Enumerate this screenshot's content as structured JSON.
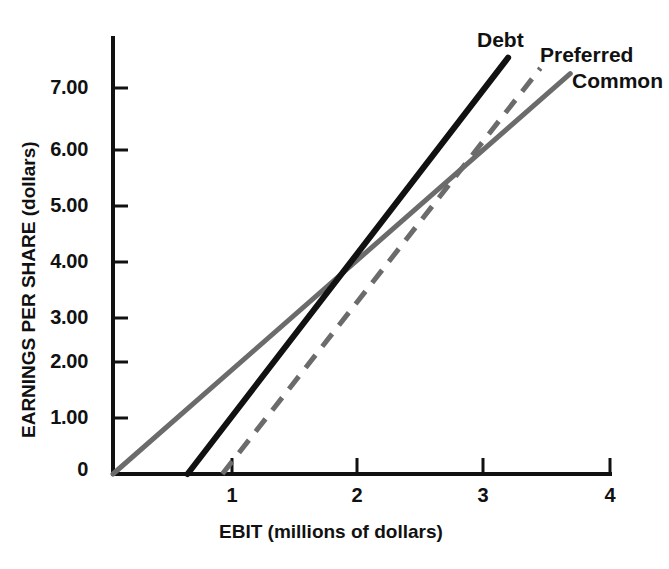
{
  "chart_data": {
    "type": "line",
    "title": "",
    "subtitle": "",
    "xlabel": "EBIT (millions of dollars)",
    "ylabel": "EARNINGS PER SHARE (dollars)",
    "xlim": [
      0,
      4
    ],
    "ylim": [
      0,
      7.8
    ],
    "grid": false,
    "legend_position": "inline-right-of-line-ends",
    "x_ticks": [
      "1",
      "2",
      "3",
      "4"
    ],
    "x_tick_values": [
      1,
      2,
      3,
      4
    ],
    "y_ticks": [
      "0",
      "1.00",
      "2.00",
      "3.00",
      "4.00",
      "5.00",
      "6.00",
      "7.00"
    ],
    "y_tick_values": [
      0,
      1,
      2,
      3,
      4,
      5,
      6,
      7
    ],
    "series": [
      {
        "name": "Debt",
        "style": "solid",
        "color": "#111111",
        "x_intercept": 0.6,
        "slope": 2.93,
        "points": [
          [
            0.6,
            0
          ],
          [
            3.18,
            7.55
          ]
        ],
        "values": [
          0,
          1.17,
          4.1,
          7.03
        ]
      },
      {
        "name": "Preferred",
        "style": "dashed",
        "color": "#6b6b6b",
        "x_intercept": 0.88,
        "slope": 2.87,
        "points": [
          [
            0.88,
            0
          ],
          [
            3.44,
            7.36
          ]
        ],
        "values": [
          0,
          0.34,
          3.21,
          6.09
        ]
      },
      {
        "name": "Common",
        "style": "solid",
        "color": "#6b6b6b",
        "x_intercept": 0.0,
        "slope": 1.97,
        "points": [
          [
            0.0,
            0
          ],
          [
            3.68,
            7.26
          ]
        ],
        "values": [
          0,
          1.97,
          3.95,
          5.92
        ]
      }
    ],
    "annotations": [
      {
        "label": "Debt/Common crossover",
        "x": 1.87,
        "y": 3.63
      },
      {
        "label": "Preferred/Common crossover",
        "x": 2.66,
        "y": 5.22
      }
    ]
  },
  "axis": {
    "y_title": "EARNINGS PER SHARE (dollars)",
    "x_title": "EBIT (millions of dollars)",
    "y_labels": [
      "7.00",
      "6.00",
      "5.00",
      "4.00",
      "3.00",
      "2.00",
      "1.00",
      "0"
    ],
    "x_labels": [
      "1",
      "2",
      "3",
      "4"
    ]
  },
  "labels": {
    "debt": "Debt",
    "preferred": "Preferred",
    "common": "Common"
  }
}
